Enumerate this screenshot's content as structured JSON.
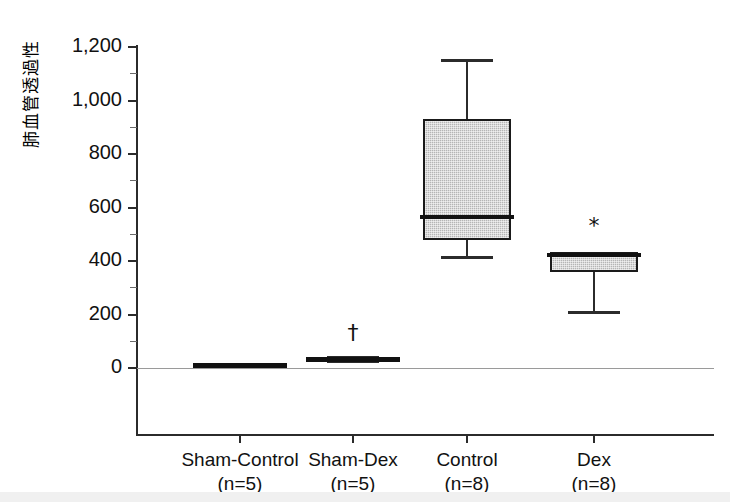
{
  "chart_data": {
    "type": "box",
    "title": "",
    "xlabel": "",
    "ylabel": "肺血管透過性",
    "ylim": [
      0,
      1200
    ],
    "ytick_values": [
      0,
      200,
      400,
      600,
      800,
      1000,
      1200
    ],
    "ytick_labels": [
      "0",
      "200",
      "400",
      "600",
      "800",
      "1,000",
      "1,200"
    ],
    "yminor_values": [
      100,
      300,
      500,
      700,
      900,
      1100
    ],
    "grid": false,
    "legend": "none",
    "categories": [
      "Sham-Control",
      "Sham-Dex",
      "Control",
      "Dex"
    ],
    "group_sizes": [
      "(n=5)",
      "(n=5)",
      "(n=8)",
      "(n=8)"
    ],
    "boxes": [
      {
        "name": "Sham-Control",
        "n_label": "(n=5)",
        "whisker_low": 2,
        "q1": 5,
        "median": 10,
        "q3": 18,
        "whisker_high": 20,
        "fill": "solid-dark",
        "marker": ""
      },
      {
        "name": "Sham-Dex",
        "n_label": "(n=5)",
        "whisker_low": 22,
        "q1": 25,
        "median": 32,
        "q3": 42,
        "whisker_high": 45,
        "fill": "solid-dark",
        "marker": "†"
      },
      {
        "name": "Control",
        "n_label": "(n=8)",
        "whisker_low": 410,
        "q1": 478,
        "median": 563,
        "q3": 930,
        "whisker_high": 1155,
        "fill": "gray-hatch",
        "marker": ""
      },
      {
        "name": "Dex",
        "n_label": "(n=8)",
        "whisker_low": 205,
        "q1": 358,
        "median": 422,
        "q3": 433,
        "whisker_high": 433,
        "fill": "gray-hatch",
        "marker": "*"
      }
    ],
    "annotations": [
      {
        "text": "†",
        "category": "Sham-Dex",
        "value": 130
      },
      {
        "text": "*",
        "category": "Dex",
        "value": 530
      }
    ],
    "colors": {
      "box_fill_gray": "#b5b5b5",
      "box_fill_dark": "#111111",
      "line": "#1a1a1a",
      "axis": "#2b2b2b",
      "zero_line": "#9a9a9a",
      "text": "#111111",
      "background": "#ffffff"
    }
  }
}
